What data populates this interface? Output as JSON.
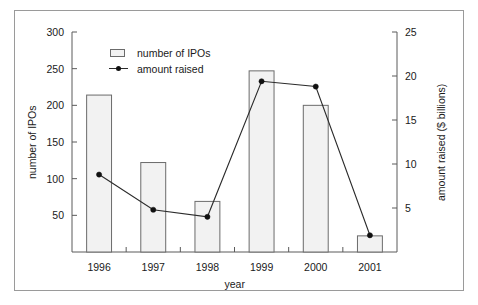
{
  "chart_data": {
    "type": "bar",
    "title": "",
    "subtitle": "",
    "xlabel": "year",
    "ylabel": "number of IPOs",
    "y2label": "amount raised ($ billions)",
    "categories": [
      "1996",
      "1997",
      "1998",
      "1999",
      "2000",
      "2001"
    ],
    "ylim": [
      0,
      300
    ],
    "y2lim": [
      0,
      25
    ],
    "yticks": [
      "50",
      "100",
      "150",
      "200",
      "250",
      "300"
    ],
    "ytick_values": [
      50,
      100,
      150,
      200,
      250,
      300
    ],
    "y2ticks": [
      "5",
      "10",
      "15",
      "20",
      "25"
    ],
    "y2tick_values": [
      5,
      10,
      15,
      20,
      25
    ],
    "grid": false,
    "legend_position": "upper-left-inside",
    "series": [
      {
        "name": "number of IPOs",
        "type": "bar",
        "axis": "left",
        "values": [
          214,
          122,
          69,
          247,
          200,
          22
        ]
      },
      {
        "name": "amount raised",
        "type": "line",
        "axis": "right",
        "units": "$ billions",
        "values": [
          8.8,
          4.8,
          4.0,
          19.4,
          18.8,
          1.9
        ]
      }
    ]
  },
  "legend": {
    "items": [
      {
        "label": "number of IPOs",
        "marker": "open-rectangle"
      },
      {
        "label": "amount raised",
        "marker": "line-with-dot"
      }
    ]
  },
  "colors": {
    "bar_fill": "#f2f2f2",
    "bar_border": "#6b6b6b",
    "line": "#2b2b2b",
    "marker": "#111111",
    "axis": "#5a5a5a",
    "text": "#1a1a1a",
    "frame": "#9a9a9a",
    "background": "#ffffff"
  }
}
